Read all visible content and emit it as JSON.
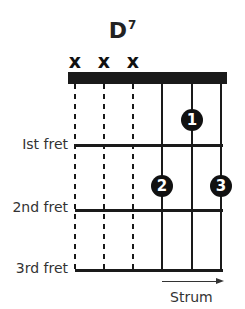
{
  "chord": {
    "name": "D",
    "superscript": "7"
  },
  "muted_strings": [
    {
      "label": "x"
    },
    {
      "label": "x"
    },
    {
      "label": "x"
    }
  ],
  "fret_labels": {
    "first": "Ist fret",
    "second": "2nd fret",
    "third": "3rd fret"
  },
  "fingers": [
    {
      "number": "1",
      "string": 5,
      "fret": 1
    },
    {
      "number": "2",
      "string": 4,
      "fret": 2
    },
    {
      "number": "3",
      "string": 6,
      "fret": 2
    }
  ],
  "strum": {
    "label": "Strum",
    "direction": "right"
  },
  "colors": {
    "ink": "#1a1a1a",
    "label": "#333333",
    "background": "#ffffff"
  }
}
